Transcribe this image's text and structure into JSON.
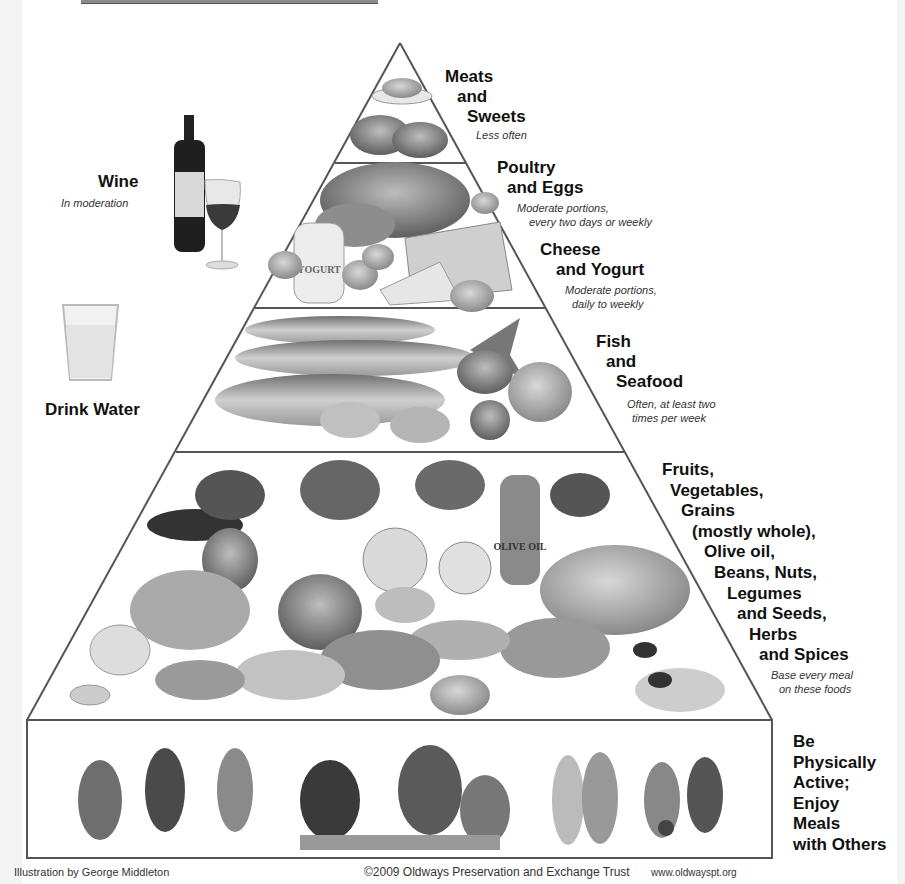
{
  "diagram": {
    "type": "food-pyramid",
    "tiers": [
      {
        "id": "meats-sweets",
        "label_lines": [
          "Meats",
          "and",
          "Sweets"
        ],
        "note_lines": [
          "Less often"
        ],
        "illustration": "bowl of sweets and red meat cuts"
      },
      {
        "id": "poultry-eggs",
        "label_lines": [
          "Poultry",
          "and Eggs"
        ],
        "note_lines": [
          "Moderate portions,",
          "every two days or weekly"
        ],
        "illustration": "roast chicken and eggs"
      },
      {
        "id": "cheese-yogurt",
        "label_lines": [
          "Cheese",
          "and Yogurt"
        ],
        "note_lines": [
          "Moderate portions,",
          "daily to weekly"
        ],
        "illustration": "yogurt jar and cheese wedges",
        "jar_text": "YOGURT"
      },
      {
        "id": "fish-seafood",
        "label_lines": [
          "Fish",
          "and",
          "Seafood"
        ],
        "note_lines": [
          "Often, at least two",
          "times per week"
        ],
        "illustration": "fish, shrimp and shellfish"
      },
      {
        "id": "plant-foods",
        "label_lines": [
          "Fruits,",
          "Vegetables,",
          "Grains",
          "(mostly whole),",
          "Olive oil,",
          "Beans, Nuts,",
          "Legumes",
          "and Seeds,",
          "Herbs",
          "and Spices"
        ],
        "note_lines": [
          "Base every meal",
          "on these foods"
        ],
        "illustration": "fruits, vegetables, bread, olive oil, grains, nuts",
        "bottle_text": "OLIVE OIL"
      },
      {
        "id": "activity-meals",
        "label_lines": [
          "Be",
          "Physically",
          "Active;",
          "Enjoy",
          "Meals",
          "with Others"
        ],
        "illustration": "people dancing, sharing a meal, walking, playing soccer"
      }
    ],
    "side_items": [
      {
        "id": "wine",
        "label": "Wine",
        "note": "In moderation",
        "illustration": "wine bottle and glass"
      },
      {
        "id": "water",
        "label": "Drink Water",
        "illustration": "glass of water"
      }
    ],
    "footer": {
      "illustrator": "Illustration by George Middleton",
      "copyright": "©2009 Oldways Preservation and Exchange Trust",
      "website": "www.oldwayspt.org"
    }
  }
}
